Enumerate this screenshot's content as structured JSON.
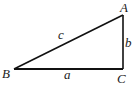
{
  "diagram": {
    "type": "right-triangle",
    "vertices": [
      {
        "name": "A",
        "x": 123,
        "y": 15,
        "label_x": 122,
        "label_y": 12
      },
      {
        "name": "B",
        "x": 14,
        "y": 69,
        "label_x": 3,
        "label_y": 77
      },
      {
        "name": "C",
        "x": 123,
        "y": 69,
        "label_x": 118,
        "label_y": 82
      }
    ],
    "sides": [
      {
        "name": "a",
        "from": "B",
        "to": "C",
        "label_x": 65,
        "label_y": 78
      },
      {
        "name": "b",
        "from": "C",
        "to": "A",
        "label_x": 125,
        "label_y": 46
      },
      {
        "name": "c",
        "from": "B",
        "to": "A",
        "label_x": 60,
        "label_y": 40
      }
    ],
    "right_angle_at": "C",
    "stroke_color": "#111111",
    "background": "#ffffff"
  }
}
